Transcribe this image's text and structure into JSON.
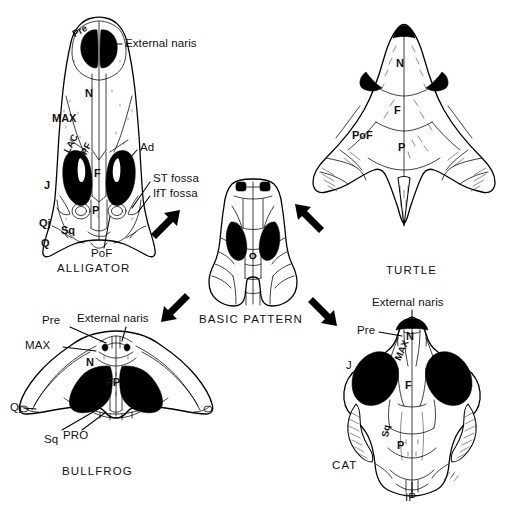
{
  "figure": {
    "type": "comparative-anatomy-diagram",
    "ink_color": "#000000",
    "background_color": "#ffffff"
  },
  "panels": [
    {
      "id": "alligator",
      "caption": "ALLIGATOR",
      "position": "top-left",
      "lead_labels": [
        {
          "text": "External naris"
        },
        {
          "text": "Ad"
        },
        {
          "text": "ST fossa"
        },
        {
          "text": "IfT fossa"
        },
        {
          "text": "PoF"
        }
      ],
      "bone_labels": [
        {
          "text": "Pre"
        },
        {
          "text": "N"
        },
        {
          "text": "MAX"
        },
        {
          "text": "LAC"
        },
        {
          "text": "PF"
        },
        {
          "text": "F"
        },
        {
          "text": "J"
        },
        {
          "text": "P"
        },
        {
          "text": "Sq"
        },
        {
          "text": "Qj"
        },
        {
          "text": "Q"
        }
      ]
    },
    {
      "id": "turtle",
      "caption": "TURTLE",
      "position": "top-right",
      "lead_labels": [],
      "bone_labels": [
        {
          "text": "N"
        },
        {
          "text": "F"
        },
        {
          "text": "PoF"
        },
        {
          "text": "P"
        }
      ]
    },
    {
      "id": "basic-pattern",
      "caption": "BASIC PATTERN",
      "position": "center",
      "lead_labels": [],
      "bone_labels": [
        {
          "text": "O"
        }
      ]
    },
    {
      "id": "bullfrog",
      "caption": "BULLFROG",
      "position": "bottom-left",
      "lead_labels": [
        {
          "text": "Pre"
        },
        {
          "text": "External naris"
        },
        {
          "text": "MAX"
        },
        {
          "text": "Qj"
        },
        {
          "text": "Sq"
        },
        {
          "text": "PRO"
        }
      ],
      "bone_labels": [
        {
          "text": "N"
        },
        {
          "text": "FP"
        }
      ]
    },
    {
      "id": "cat",
      "caption": "CAT",
      "position": "bottom-right",
      "lead_labels": [
        {
          "text": "External naris"
        },
        {
          "text": "Pre"
        },
        {
          "text": "J"
        },
        {
          "text": "IP"
        }
      ],
      "bone_labels": [
        {
          "text": "N"
        },
        {
          "text": "MAX"
        },
        {
          "text": "F"
        },
        {
          "text": "Sq"
        },
        {
          "text": "P"
        }
      ]
    }
  ],
  "arrows": [
    {
      "name": "to-alligator",
      "direction": "up-left"
    },
    {
      "name": "to-turtle",
      "direction": "up-right"
    },
    {
      "name": "to-bullfrog",
      "direction": "down-left"
    },
    {
      "name": "to-cat",
      "direction": "down-right"
    }
  ]
}
